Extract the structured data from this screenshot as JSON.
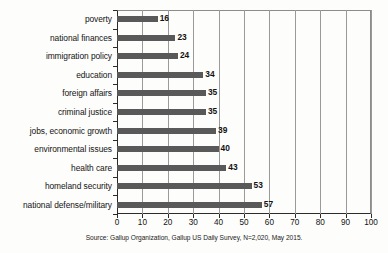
{
  "chart_data": {
    "type": "bar",
    "orientation": "horizontal",
    "title": "",
    "xlabel": "",
    "ylabel": "",
    "xlim": [
      0,
      100
    ],
    "xticks": [
      0,
      10,
      20,
      30,
      40,
      50,
      60,
      70,
      80,
      90,
      100
    ],
    "grid": true,
    "legend": null,
    "bar_color": "#59595a",
    "categories": [
      "poverty",
      "national finances",
      "immigration policy",
      "education",
      "foreign affairs",
      "criminal justice",
      "jobs, economic growth",
      "environmental issues",
      "health care",
      "homeland security",
      "national defense/military"
    ],
    "values": [
      16,
      23,
      24,
      34,
      35,
      35,
      39,
      40,
      43,
      53,
      57
    ],
    "data_labels": [
      "16",
      "23",
      "24",
      "34",
      "35",
      "35",
      "39",
      "40",
      "43",
      "53",
      "57"
    ],
    "source_note": "Source: Gallup Organization, Gallup US Daily Survey, N=2,020, May 2015."
  }
}
